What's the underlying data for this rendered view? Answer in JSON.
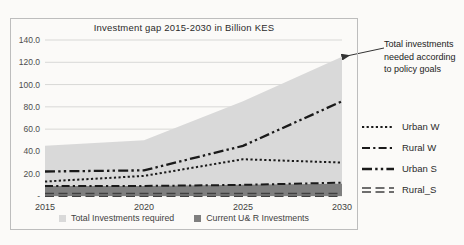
{
  "page": {
    "background": "#fbfaf8"
  },
  "chart": {
    "bottom_legend": [
      {
        "label": "Total Investments required",
        "color": "#d9d9d9"
      },
      {
        "label": "Current U& R Investments",
        "color": "#7f7f7f"
      }
    ]
  },
  "chart_data": {
    "type": "area",
    "title": "Investment gap 2015-2030 in Billion KES",
    "unit": "Billion KES",
    "x": [
      2015,
      2020,
      2025,
      2030
    ],
    "x_ticklabels": [
      "2015",
      "2020",
      "2025",
      "2030"
    ],
    "y_ticks": [
      0,
      20,
      40,
      60,
      80,
      100,
      120,
      140
    ],
    "y_ticklabels": [
      "-",
      "20.0",
      "40.0",
      "60.0",
      "80.0",
      "100.0",
      "120.0",
      "140.0"
    ],
    "ylim": [
      0,
      140
    ],
    "grid": true,
    "legend_position": "right",
    "areas": [
      {
        "name": "Total Investments required",
        "color": "#d9d9d9",
        "values": [
          45,
          50,
          85,
          125
        ]
      },
      {
        "name": "Current U& R Investments",
        "color": "#7f7f7f",
        "values": [
          9,
          9,
          10,
          11
        ]
      }
    ],
    "series": [
      {
        "name": "Urban W",
        "style": "dotted",
        "color": "#1a1a1a",
        "values": [
          13,
          18,
          33,
          30
        ]
      },
      {
        "name": "Rural W",
        "style": "dash-dot",
        "color": "#1a1a1a",
        "values": [
          9,
          9,
          10,
          12
        ]
      },
      {
        "name": "Urban S",
        "style": "dash-dot-dot",
        "color": "#1a1a1a",
        "values": [
          22,
          23,
          45,
          85
        ]
      },
      {
        "name": "Rural_S",
        "style": "double-dash",
        "color": "#404040",
        "values": [
          1,
          1,
          1,
          1
        ]
      }
    ],
    "annotation": "Total investments needed according to policy goals"
  }
}
